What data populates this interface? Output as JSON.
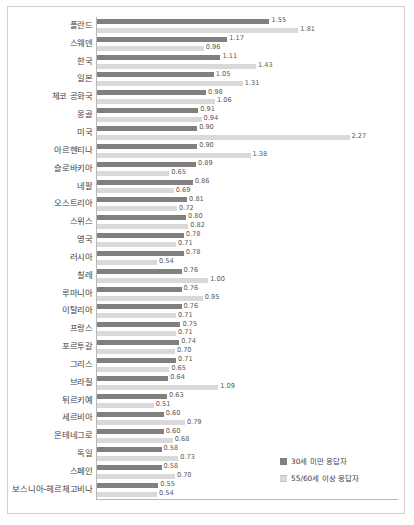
{
  "legend": {
    "position": "bottom-right",
    "items": [
      {
        "label": "30세 미만 응답자",
        "key": "young",
        "color": "#808080",
        "icon": "legend-swatch"
      },
      {
        "label": "55/60세 이상 응답자",
        "key": "old",
        "color": "#d9d9d9",
        "icon": "legend-swatch"
      }
    ]
  },
  "chart_data": {
    "type": "bar",
    "orientation": "horizontal",
    "title": "",
    "subtitle": "",
    "xlabel": "",
    "ylabel": "",
    "xlim": [
      0,
      2.4
    ],
    "grid": false,
    "legend_position": "bottom-right",
    "categories": [
      "폴란드",
      "스웨덴",
      "한국",
      "일본",
      "체코 공화국",
      "몽골",
      "미국",
      "아르헨티나",
      "슬로바키아",
      "네팔",
      "오스트리아",
      "스위스",
      "영국",
      "러시아",
      "칠레",
      "루마니아",
      "이탈리아",
      "프랑스",
      "포르투갈",
      "그리스",
      "브라질",
      "튀르키예",
      "세르비아",
      "몬테네그로",
      "독일",
      "스페인",
      "보스니아-헤르체고비나"
    ],
    "series": [
      {
        "name": "30세 미만 응답자",
        "color": "#808080",
        "values": [
          1.55,
          1.17,
          1.11,
          1.05,
          0.98,
          0.91,
          0.9,
          0.9,
          0.89,
          0.86,
          0.81,
          0.8,
          0.78,
          0.78,
          0.76,
          0.76,
          0.76,
          0.75,
          0.74,
          0.71,
          0.64,
          0.63,
          0.6,
          0.6,
          0.58,
          0.58,
          0.55
        ],
        "labels": [
          "1.55",
          "1.17",
          "1.11",
          "1.05",
          "0.98",
          "0.91",
          "0.90",
          "0.90",
          "0.89",
          "0.86",
          "0.81",
          "0.80",
          "0.78",
          "0.78",
          "0.76",
          "0.76",
          "0.76",
          "0.75",
          "0.74",
          "0.71",
          "0.64",
          "0.63",
          "0.60",
          "0.60",
          "0.58",
          "0.58",
          "0.55"
        ]
      },
      {
        "name": "55/60세 이상 응답자",
        "color": "#d9d9d9",
        "values": [
          1.81,
          0.96,
          1.43,
          1.31,
          1.06,
          0.94,
          2.27,
          1.38,
          0.65,
          0.69,
          0.72,
          0.82,
          0.71,
          0.54,
          1.0,
          0.95,
          0.71,
          0.71,
          0.7,
          0.65,
          1.09,
          0.51,
          0.79,
          0.68,
          0.73,
          0.7,
          0.54
        ],
        "labels": [
          "1.81",
          "0.96",
          "1.43",
          "1.31",
          "1.06",
          "0.94",
          "2.27",
          "1.38",
          "0.65",
          "0.69",
          "0.72",
          "0.82",
          "0.71",
          "0.54",
          "1.00",
          "0.95",
          "0.71",
          "0.71",
          "0.70",
          "0.65",
          "1.09",
          "0.51",
          "0.79",
          "0.68",
          "0.73",
          "0.70",
          "0.54"
        ]
      }
    ]
  }
}
